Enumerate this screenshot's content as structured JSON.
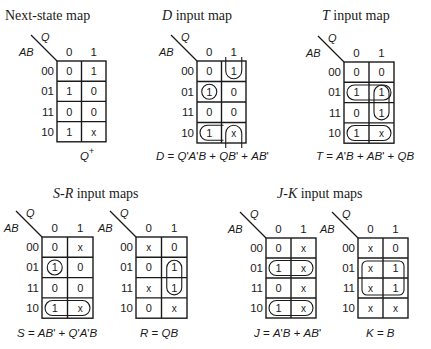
{
  "maps": [
    {
      "id": "next-state",
      "title_italic": "",
      "title_rest": "Next-state map",
      "title_x": 5,
      "title_y": 20,
      "grid": {
        "x": 57,
        "y": 61,
        "cw": 24.5,
        "rh": 20.2
      },
      "col_var": "Q",
      "row_var": "AB",
      "cols": [
        "0",
        "1"
      ],
      "rows": [
        "00",
        "01",
        "11",
        "10"
      ],
      "cells": [
        [
          "0",
          "1"
        ],
        [
          "1",
          "0"
        ],
        [
          "0",
          "0"
        ],
        [
          "1",
          "x"
        ]
      ],
      "equation": "Q+",
      "equation_x": 80,
      "equation_y": 160,
      "loops": []
    },
    {
      "id": "d-input",
      "title_italic": "D",
      "title_rest": " input map",
      "title_x": 162,
      "title_y": 20,
      "grid": {
        "x": 197,
        "y": 61,
        "cw": 24.5,
        "rh": 20.5
      },
      "col_var": "Q",
      "row_var": "AB",
      "cols": [
        "0",
        "1"
      ],
      "rows": [
        "00",
        "01",
        "11",
        "10"
      ],
      "cells": [
        [
          "0",
          "1"
        ],
        [
          "1",
          "0"
        ],
        [
          "0",
          "0"
        ],
        [
          "1",
          "x"
        ]
      ],
      "equation": "D = Q'A'B + QB' + AB'",
      "equation_x": 156,
      "equation_y": 160,
      "loops": [
        {
          "type": "u-top",
          "col": 1,
          "row": 0
        },
        {
          "type": "circle",
          "col": 0,
          "row": 1
        },
        {
          "type": "left-cap",
          "col": 0,
          "row": 3
        },
        {
          "type": "arch-bottom",
          "col": 1,
          "row": 3
        }
      ]
    },
    {
      "id": "t-input",
      "title_italic": "T",
      "title_rest": " input map",
      "title_x": 322,
      "title_y": 20,
      "grid": {
        "x": 344,
        "y": 62,
        "cw": 25,
        "rh": 20.3
      },
      "col_var": "Q",
      "row_var": "AB",
      "cols": [
        "0",
        "1"
      ],
      "rows": [
        "00",
        "01",
        "11",
        "10"
      ],
      "cells": [
        [
          "0",
          "0"
        ],
        [
          "1",
          "1"
        ],
        [
          "0",
          "1"
        ],
        [
          "1",
          "x"
        ]
      ],
      "equation": "T = A'B + AB' + QB",
      "equation_x": 316,
      "equation_y": 160,
      "loops": [
        {
          "type": "hpair",
          "row": 1
        },
        {
          "type": "vpair",
          "col": 1,
          "row": 1
        },
        {
          "type": "hpair",
          "row": 3
        }
      ]
    },
    {
      "id": "s-input",
      "title_italic": "S-R",
      "title_rest": " input maps",
      "title_x": 53,
      "title_y": 198,
      "grid": {
        "x": 42,
        "y": 237,
        "cw": 25.5,
        "rh": 20.3
      },
      "col_var": "Q",
      "row_var": "AB",
      "cols": [
        "0",
        "1"
      ],
      "rows": [
        "00",
        "01",
        "11",
        "10"
      ],
      "cells": [
        [
          "0",
          "x"
        ],
        [
          "1",
          "0"
        ],
        [
          "0",
          "0"
        ],
        [
          "1",
          "x"
        ]
      ],
      "equation": "S = AB' + Q'A'B",
      "equation_x": 17,
      "equation_y": 337,
      "loops": [
        {
          "type": "circle",
          "col": 0,
          "row": 1
        },
        {
          "type": "hpair",
          "row": 3
        }
      ]
    },
    {
      "id": "r-input",
      "title_italic": "",
      "title_rest": "",
      "title_x": 0,
      "title_y": 0,
      "grid": {
        "x": 136,
        "y": 237,
        "cw": 25.5,
        "rh": 20.3
      },
      "col_var": "Q",
      "row_var": "AB",
      "cols": [
        "0",
        "1"
      ],
      "rows": [
        "00",
        "01",
        "11",
        "10"
      ],
      "cells": [
        [
          "x",
          "0"
        ],
        [
          "0",
          "1"
        ],
        [
          "x",
          "1"
        ],
        [
          "0",
          "x"
        ]
      ],
      "equation": "R = QB",
      "equation_x": 140,
      "equation_y": 337,
      "loops": [
        {
          "type": "vpair",
          "col": 1,
          "row": 1
        }
      ]
    },
    {
      "id": "j-input",
      "title_italic": "J-K",
      "title_rest": " input maps",
      "title_x": 277,
      "title_y": 198,
      "grid": {
        "x": 266,
        "y": 238,
        "cw": 25,
        "rh": 20
      },
      "col_var": "Q",
      "row_var": "AB",
      "cols": [
        "0",
        "1"
      ],
      "rows": [
        "00",
        "01",
        "11",
        "10"
      ],
      "cells": [
        [
          "0",
          "x"
        ],
        [
          "1",
          "x"
        ],
        [
          "0",
          "x"
        ],
        [
          "1",
          "x"
        ]
      ],
      "equation": "J = A'B + AB'",
      "equation_x": 254,
      "equation_y": 337,
      "loops": [
        {
          "type": "hpair",
          "row": 1
        },
        {
          "type": "hpair",
          "row": 3
        }
      ]
    },
    {
      "id": "k-input",
      "title_italic": "",
      "title_rest": "",
      "title_x": 0,
      "title_y": 0,
      "grid": {
        "x": 358,
        "y": 238,
        "cw": 25,
        "rh": 20
      },
      "col_var": "Q",
      "row_var": "AB",
      "cols": [
        "0",
        "1"
      ],
      "rows": [
        "00",
        "01",
        "11",
        "10"
      ],
      "cells": [
        [
          "x",
          "0"
        ],
        [
          "x",
          "1"
        ],
        [
          "x",
          "1"
        ],
        [
          "x",
          "x"
        ]
      ],
      "equation": "K = B",
      "equation_x": 366,
      "equation_y": 337,
      "loops": [
        {
          "type": "quad",
          "row": 1
        }
      ]
    }
  ],
  "labels": {
    "next_state_title": "Next-state map",
    "d_title": "D input map",
    "t_title": "T input map",
    "sr_title": "S-R input maps",
    "jk_title": "J-K input maps",
    "q_plus": "Q+",
    "d_equation": "D = Q'A'B + QB' + AB'",
    "t_equation": "T = A'B + AB' + QB",
    "s_equation": "S = AB' + Q'A'B",
    "r_equation": "R = QB",
    "j_equation": "J = A'B + AB'",
    "k_equation": "K = B"
  }
}
